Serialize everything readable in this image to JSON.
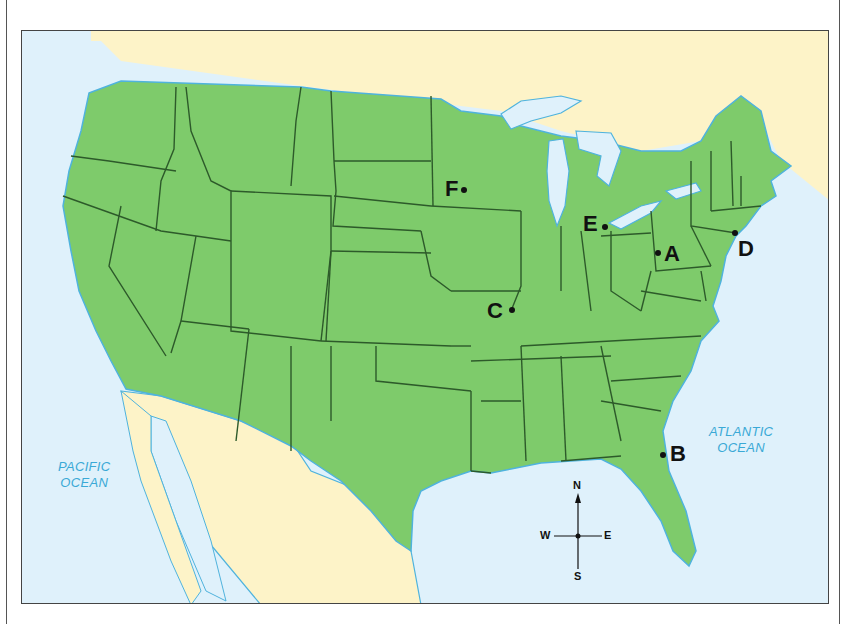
{
  "map": {
    "type": "outline map of the contiguous United States",
    "colors": {
      "land_us": "#7ecb6b",
      "land_foreign": "#fdf3c8",
      "water": "#dff1fb",
      "state_border": "#2d5a2a",
      "coast": "#4fb3dd",
      "ocean_text": "#3aa9d6"
    },
    "oceans": [
      {
        "id": "pacific",
        "line1": "PACIFIC",
        "line2": "OCEAN"
      },
      {
        "id": "atlantic",
        "line1": "ATLANTIC",
        "line2": "OCEAN"
      }
    ],
    "points": [
      {
        "label": "A",
        "location_hint": "central Pennsylvania"
      },
      {
        "label": "B",
        "location_hint": "northeast Florida coast"
      },
      {
        "label": "C",
        "location_hint": "eastern Missouri / St. Louis"
      },
      {
        "label": "D",
        "location_hint": "New York City"
      },
      {
        "label": "E",
        "location_hint": "southeast Michigan / Detroit"
      },
      {
        "label": "F",
        "location_hint": "southeast Minnesota"
      }
    ],
    "compass": {
      "n": "N",
      "s": "S",
      "e": "E",
      "w": "W"
    }
  }
}
